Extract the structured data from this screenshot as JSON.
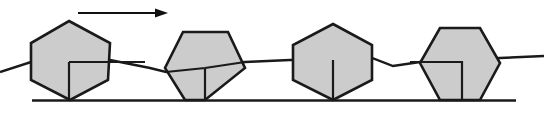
{
  "figure": {
    "canvas": {
      "width": 544,
      "height": 113
    },
    "colors": {
      "fill": "#cccccc",
      "stroke": "#1a1a1a",
      "background": "#ffffff",
      "arrow": "#111111"
    },
    "direction_arrow": {
      "label": "direction-of-motion",
      "points_to": "right",
      "shaft_start_x": 78,
      "shaft_end_x": 163,
      "y": 13,
      "head_length": 11,
      "head_half_width": 4.5
    },
    "ground": {
      "label": "ground-line",
      "x1": 32,
      "y1": 100.5,
      "x2": 516,
      "y2": 100.5
    },
    "path_polyline": {
      "label": "traced-path",
      "points": "0,72 31,62 69,62 110,60 150,68 166,72 193,66 245,62 290,60 333,60 372,58 393,66 420,62 462,60 500,58 544,56"
    },
    "hexagons": [
      {
        "name": "hexagon-position-1",
        "order": 1,
        "orientation": "vertex-top-vertex-bottom",
        "outline": "69,21 110,43 108,80 70,100 31,80 31,43",
        "inner": "M 69,62 L 145,62 M 69,62 L 69,100",
        "inner_note": "L-shaped interior marker: horizontal segment from center to right, vertical segment from center down to ground contact"
      },
      {
        "name": "hexagon-position-2",
        "order": 2,
        "orientation": "flat-top-vertex-bottom",
        "outline": "183,32 228,32 245,68 205,100 185,100 165,68",
        "inner": "M 166,72 L 205,68 L 245,62 M 205,68 L 205,100",
        "inner_note": "Y-shaped interior marker converging at center, with stem down to ground contact point"
      },
      {
        "name": "hexagon-position-3",
        "order": 3,
        "orientation": "vertex-top-vertex-bottom",
        "outline": "333,24 372,45 372,80 333,100 293,80 293,45"
      },
      {
        "name": "hexagon-position-4",
        "order": 4,
        "orientation": "flat-top-vertex-bottom",
        "outline": "440,28 480,28 500,63 480,100 440,100 420,63",
        "inner": "M 410,62 L 462,62 L 462,100",
        "inner_note": "L-shaped interior marker: horizontal segment entering from left, turning down to the ground line"
      }
    ]
  }
}
